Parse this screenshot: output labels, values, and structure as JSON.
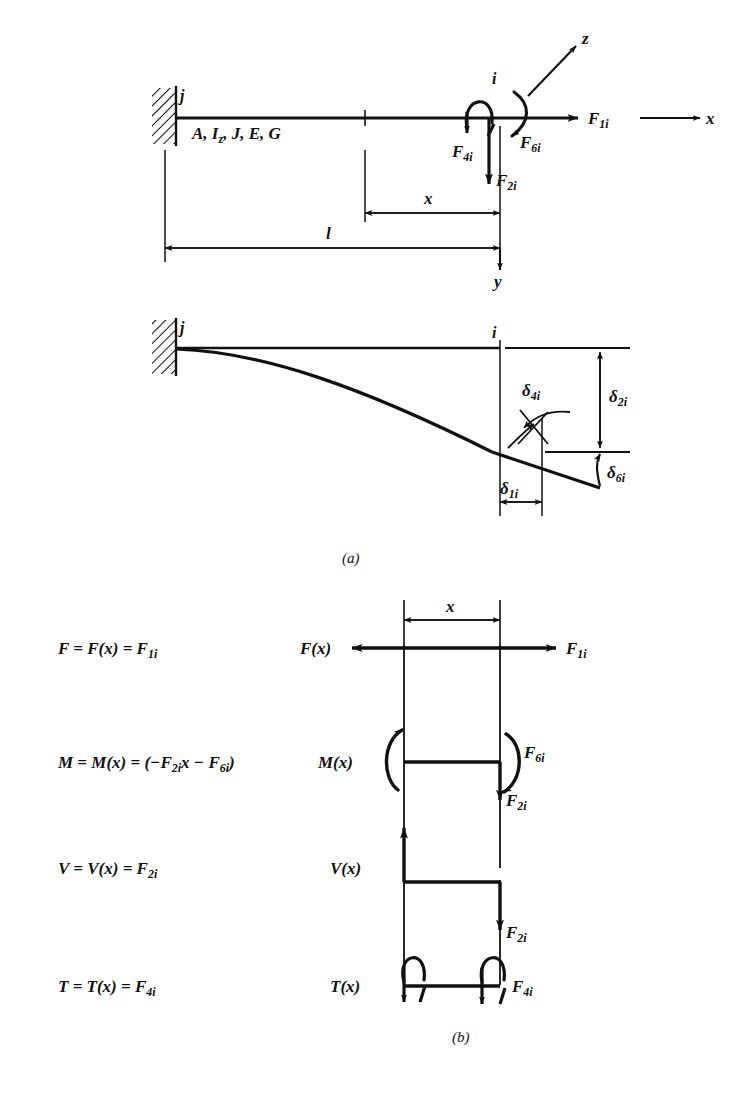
{
  "figure": {
    "captions": {
      "a": "(a)",
      "b": "(b)"
    },
    "colors": {
      "ink": "#111111",
      "paper": "#ffffff"
    }
  },
  "panel_a": {
    "beam": {
      "support_type": "fixed-wall-hatched",
      "node_j": "j",
      "node_i": "i",
      "properties_label": "A, I",
      "properties_sub": "z",
      "properties_rest": ", J, E, G",
      "properties_full": "A, Iz, J, E, G"
    },
    "axes": [
      {
        "name": "x-axis",
        "label": "x"
      },
      {
        "name": "y-axis",
        "label": "y"
      },
      {
        "name": "z-axis",
        "label": "z"
      }
    ],
    "dimensions": [
      {
        "name": "length-x",
        "label": "x"
      },
      {
        "name": "length-l",
        "label": "l"
      }
    ],
    "forces": [
      {
        "name": "axial-force",
        "base": "F",
        "sub": "1i",
        "full": "F1i"
      },
      {
        "name": "shear-force",
        "base": "F",
        "sub": "2i",
        "full": "F2i"
      },
      {
        "name": "torsion-moment",
        "base": "F",
        "sub": "4i",
        "full": "F4i"
      },
      {
        "name": "bending-moment",
        "base": "F",
        "sub": "6i",
        "full": "F6i"
      }
    ],
    "deflections": [
      {
        "name": "axial-displacement",
        "base": "δ",
        "sub": "1i",
        "full": "δ1i"
      },
      {
        "name": "transverse-deflection",
        "base": "δ",
        "sub": "2i",
        "full": "δ2i"
      },
      {
        "name": "twist-rotation",
        "base": "δ",
        "sub": "4i",
        "full": "δ4i"
      },
      {
        "name": "bending-rotation",
        "base": "δ",
        "sub": "6i",
        "full": "δ6i"
      }
    ]
  },
  "panel_b": {
    "equations": [
      {
        "name": "axial-equation",
        "text": "F = F(x) = F",
        "sub": "1i"
      },
      {
        "name": "moment-equation",
        "text": "M = M(x) = (−F",
        "sub": "2i",
        "mid": "x − F",
        "sub2": "6i",
        "tail": ")"
      },
      {
        "name": "shear-equation",
        "text": "V = V(x) = F",
        "sub": "2i"
      },
      {
        "name": "torsion-equation",
        "text": "T = T(x) = F",
        "sub": "4i"
      }
    ],
    "dimension": {
      "name": "length-x",
      "label": "x"
    },
    "diagram_labels": [
      {
        "name": "axial-function",
        "base": "F(x)"
      },
      {
        "name": "moment-function",
        "base": "M(x)"
      },
      {
        "name": "shear-function",
        "base": "V(x)"
      },
      {
        "name": "torsion-function",
        "base": "T(x)"
      }
    ],
    "end_forces": [
      {
        "name": "axial-end-force",
        "base": "F",
        "sub": "1i"
      },
      {
        "name": "moment-end-force",
        "base": "F",
        "sub": "6i"
      },
      {
        "name": "shear-end-force-moment-section",
        "base": "F",
        "sub": "2i"
      },
      {
        "name": "shear-end-force-shear-section",
        "base": "F",
        "sub": "2i"
      },
      {
        "name": "torsion-end-force",
        "base": "F",
        "sub": "4i"
      }
    ]
  }
}
